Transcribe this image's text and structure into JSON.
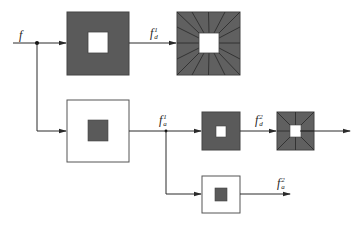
{
  "diagram": {
    "type": "wavelet decomposition block diagram",
    "colors": {
      "line": "#2a2a2a",
      "dark_fill": "#5a5a5a",
      "ray_fill": "#606060",
      "ray_line": "#2e2e2e",
      "white": "#ffffff",
      "outline": "#555555"
    },
    "labels": {
      "input": {
        "base": "f",
        "sup": "",
        "sub": ""
      },
      "detail1": {
        "base": "f",
        "sup": "1",
        "sub": "d"
      },
      "approx1": {
        "base": "f",
        "sup": "1",
        "sub": "a"
      },
      "detail2": {
        "base": "f",
        "sup": "2",
        "sub": "d"
      },
      "approx2": {
        "base": "f",
        "sup": "2",
        "sub": "a"
      }
    },
    "blocks": [
      {
        "id": "highpass-1",
        "style": "dark-with-white-center"
      },
      {
        "id": "detail-spectrum-1",
        "style": "rayed-dark-with-white-center"
      },
      {
        "id": "lowpass-1",
        "style": "white-with-dark-center"
      },
      {
        "id": "highpass-2",
        "style": "dark-with-white-center"
      },
      {
        "id": "detail-spectrum-2",
        "style": "rayed-dark-with-white-center"
      },
      {
        "id": "lowpass-2",
        "style": "white-with-dark-center"
      }
    ]
  }
}
